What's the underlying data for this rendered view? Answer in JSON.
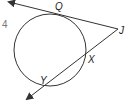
{
  "problem_number": "4",
  "points": {
    "Q": "Q",
    "J": "J",
    "X": "X",
    "Y": "Y"
  },
  "figure": {
    "stroke_color": "#333333",
    "circle": {
      "cx": 50,
      "cy": 50,
      "r": 36
    },
    "tangent_line": {
      "from": "J",
      "through": "Q",
      "arrow": true
    },
    "secant_line": {
      "from": "J",
      "through": [
        "X",
        "Y"
      ],
      "arrow": true
    }
  }
}
